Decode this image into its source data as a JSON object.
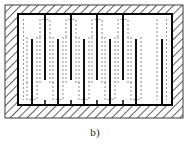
{
  "figure": {
    "caption": "b)",
    "colors": {
      "hatch_line": "#3a3a3a",
      "hatch_fill": "#ffffff",
      "outline": "#000000",
      "dashed": "#9a9a9a",
      "finger": "#111111",
      "background": "#ffffff",
      "caption_color": "#1a1a1a"
    },
    "outer_frame": {
      "x": 5,
      "y": 5,
      "width": 178,
      "height": 113,
      "hatch_angle_deg": 45,
      "hatch_spacing": 6
    },
    "inner_cavity": {
      "x": 18,
      "y": 14,
      "width": 154,
      "height": 91,
      "stroke_width": 2
    },
    "meander": {
      "top_fingers": 4,
      "bottom_fingers": 4,
      "top_arches": 4,
      "bottom_arches": 5,
      "finger_stroke_width": 2,
      "dash_pattern": "2,2",
      "finger_x_positions": [
        45,
        71,
        97,
        123,
        32,
        58,
        84,
        110,
        136,
        149
      ],
      "top_finger_x": [
        45,
        71,
        97,
        123
      ],
      "top_finger_y_start": 14,
      "top_finger_y_end": 78,
      "bottom_finger_x": [
        32,
        58,
        84,
        110,
        136
      ],
      "bottom_finger_y_start": 105,
      "bottom_finger_y_end": 40,
      "divider_x": [
        58,
        97,
        136
      ],
      "contour_inset": 5
    }
  }
}
